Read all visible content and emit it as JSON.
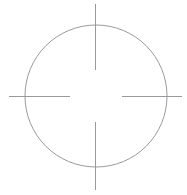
{
  "figure": {
    "name": "crosshair-target-mark",
    "canvas": {
      "width": 187,
      "height": 195,
      "background_color": "#ffffff"
    },
    "colors": {
      "background": "#ffffff",
      "circle_stroke": "#8e8e92",
      "tick_stroke": "#9a9a9e"
    },
    "stroke_widths": {
      "circle": 0.9,
      "tick": 1.0
    },
    "circle": {
      "center_x": 96,
      "center_y": 96,
      "radius": 71
    },
    "center_gap": {
      "radius": 26
    },
    "ticks": [
      {
        "id": "tick-top",
        "orientation": "vertical",
        "x1": 95.5,
        "y1": 4,
        "x2": 95.5,
        "y2": 70,
        "crosses_circle_at": 25
      },
      {
        "id": "tick-bottom",
        "orientation": "vertical",
        "x1": 95.5,
        "y1": 122,
        "x2": 95.5,
        "y2": 190,
        "crosses_circle_at": 167
      },
      {
        "id": "tick-left",
        "orientation": "horizontal",
        "x1": 9,
        "y1": 96.5,
        "x2": 70,
        "y2": 96.5,
        "crosses_circle_at": 25
      },
      {
        "id": "tick-right",
        "orientation": "horizontal",
        "x1": 122,
        "y1": 96.5,
        "x2": 182,
        "y2": 96.5,
        "crosses_circle_at": 167
      }
    ]
  }
}
